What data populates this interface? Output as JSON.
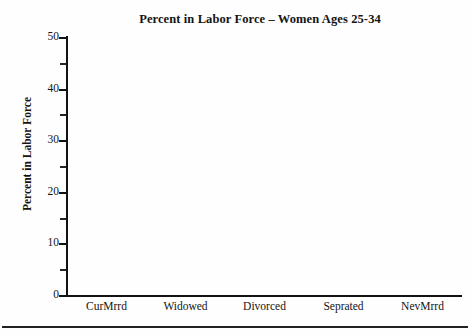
{
  "figure": {
    "background_color": "#fefefe",
    "ink_color": "#141414"
  },
  "chart_data": {
    "type": "bar",
    "title": "Percent in Labor Force – Women Ages 25-34",
    "xlabel": "",
    "ylabel": "Percent in Labor Force",
    "categories": [
      "CurMrrd",
      "Widowed",
      "Divorced",
      "Seprated",
      "NevMrrd"
    ],
    "values": [
      null,
      null,
      null,
      null,
      null
    ],
    "series": [
      {
        "name": "Percent in Labor Force",
        "values": [
          null,
          null,
          null,
          null,
          null
        ]
      }
    ],
    "ylim": [
      0,
      50
    ],
    "xlim": [
      0,
      5
    ],
    "y_major_ticks": [
      0,
      10,
      20,
      30,
      40,
      50
    ],
    "y_minor_ticks": [
      5,
      15,
      25,
      35,
      45
    ],
    "y_tick_labels": [
      "0",
      "10",
      "20",
      "30",
      "40",
      "50"
    ],
    "grid": false,
    "legend": false,
    "legend_position": "none"
  },
  "axes": {
    "y_ticks": [
      {
        "value": 50,
        "label": "50",
        "type": "major"
      },
      {
        "value": 45,
        "label": "",
        "type": "minor"
      },
      {
        "value": 40,
        "label": "40",
        "type": "major"
      },
      {
        "value": 35,
        "label": "",
        "type": "minor"
      },
      {
        "value": 30,
        "label": "30",
        "type": "major"
      },
      {
        "value": 25,
        "label": "",
        "type": "minor"
      },
      {
        "value": 20,
        "label": "20",
        "type": "major"
      },
      {
        "value": 15,
        "label": "",
        "type": "minor"
      },
      {
        "value": 10,
        "label": "10",
        "type": "major"
      },
      {
        "value": 5,
        "label": "",
        "type": "minor"
      },
      {
        "value": 0,
        "label": "0",
        "type": "major"
      }
    ],
    "x_categories": [
      {
        "label": "CurMrrd"
      },
      {
        "label": "Widowed"
      },
      {
        "label": "Divorced"
      },
      {
        "label": "Seprated"
      },
      {
        "label": "NevMrrd"
      }
    ]
  }
}
